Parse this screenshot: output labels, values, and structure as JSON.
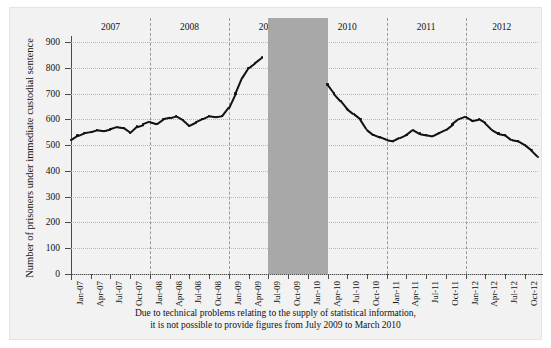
{
  "figure": {
    "note_line1": "Due to technical problems relating to the supply of statistical information,",
    "note_line2": "it is not possible to provide figures from July 2009 to March 2010"
  },
  "chart_data": {
    "type": "line",
    "title": "",
    "xlabel": "",
    "ylabel": "Number of prisoners under immediate custodial sentence",
    "ylim": [
      0,
      900
    ],
    "yticks": [
      0,
      100,
      200,
      300,
      400,
      500,
      600,
      700,
      800,
      900
    ],
    "grid": true,
    "legend": null,
    "year_bands": [
      "2007",
      "2008",
      "2009",
      "2010",
      "2011",
      "2012"
    ],
    "gap_annotation": {
      "from": "July 2009",
      "to": "March 2010",
      "color": "#a8a8a8"
    },
    "xticks": [
      "Jan-07",
      "Apr-07",
      "Jul-07",
      "Oct-07",
      "Jan-08",
      "Apr-08",
      "Jul-08",
      "Oct-08",
      "Jan-09",
      "Apr-09",
      "Jul-09",
      "Oct-09",
      "Jan-10",
      "Apr-10",
      "Jul-10",
      "Oct-10",
      "Jan-11",
      "Apr-11",
      "Jul-11",
      "Oct-11",
      "Jan-12",
      "Apr-12",
      "Jul-12",
      "Oct-12"
    ],
    "series": [
      {
        "name": "Prisoners under immediate custodial sentence",
        "color": "#111111",
        "x": [
          "2007-01",
          "2007-02",
          "2007-03",
          "2007-04",
          "2007-05",
          "2007-06",
          "2007-07",
          "2007-08",
          "2007-09",
          "2007-10",
          "2007-11",
          "2007-12",
          "2008-01",
          "2008-02",
          "2008-03",
          "2008-04",
          "2008-05",
          "2008-06",
          "2008-07",
          "2008-08",
          "2008-09",
          "2008-10",
          "2008-11",
          "2008-12",
          "2009-01",
          "2009-02",
          "2009-03",
          "2009-04",
          "2009-05",
          "2009-06",
          "2010-04",
          "2010-05",
          "2010-06",
          "2010-07",
          "2010-08",
          "2010-09",
          "2010-10",
          "2010-11",
          "2010-12",
          "2011-01",
          "2011-02",
          "2011-03",
          "2011-04",
          "2011-05",
          "2011-06",
          "2011-07",
          "2011-08",
          "2011-09",
          "2011-10",
          "2011-11",
          "2011-12",
          "2012-01",
          "2012-02",
          "2012-03",
          "2012-04",
          "2012-05",
          "2012-06",
          "2012-07",
          "2012-08",
          "2012-09",
          "2012-10",
          "2012-11",
          "2012-12"
        ],
        "values": [
          520,
          537,
          548,
          552,
          560,
          556,
          562,
          570,
          566,
          548,
          572,
          580,
          590,
          582,
          600,
          605,
          612,
          598,
          575,
          588,
          600,
          612,
          608,
          612,
          645,
          700,
          760,
          800,
          820,
          840,
          735,
          700,
          672,
          640,
          620,
          600,
          560,
          540,
          530,
          520,
          515,
          528,
          540,
          560,
          545,
          540,
          535,
          548,
          560,
          580,
          600,
          610,
          595,
          600,
          585,
          560,
          545,
          540,
          520,
          515,
          500,
          480,
          455
        ]
      }
    ],
    "series_detail": {
      "note": "Monthly series, 2007-01 to 2012-12, with a data gap July 2009 - March 2010",
      "approx_range": [
        450,
        900
      ],
      "peak_value": 900,
      "peak_period": "2009-04",
      "start_value": 520,
      "end_value": 455
    }
  }
}
